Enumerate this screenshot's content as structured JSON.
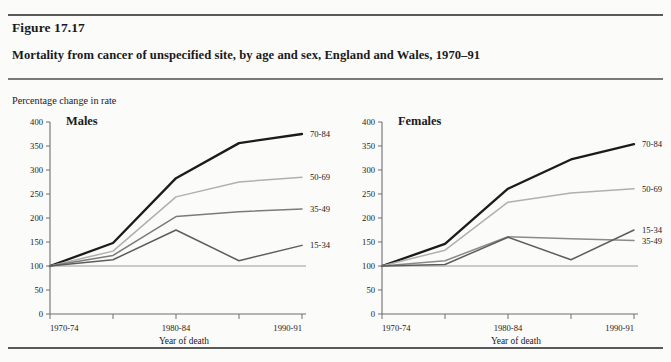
{
  "figure": {
    "number": "Figure 17.17",
    "caption": "Mortality from cancer of unspecified site, by age and sex, England and Wales, 1970–91",
    "y_axis_title": "Percentage change in rate"
  },
  "chart_data": [
    {
      "type": "line",
      "title": "Males",
      "xlabel": "Year of death",
      "ylabel": "Percentage change in rate",
      "categories": [
        "1970-74",
        "1975-79",
        "1980-84",
        "1985-89",
        "1990-91"
      ],
      "xtick_labels_shown": [
        "1970-74",
        "1980-84",
        "1990-91"
      ],
      "ytick_labels": [
        "0",
        "50",
        "100",
        "150",
        "200",
        "250",
        "300",
        "350",
        "400"
      ],
      "ylim": [
        0,
        400
      ],
      "grid": false,
      "legend_position": "right-inline",
      "series": [
        {
          "name": "70-84",
          "values": [
            100,
            148,
            283,
            356,
            375
          ],
          "color": "#1b1b1b",
          "width": 2.3
        },
        {
          "name": "50-69",
          "values": [
            100,
            131,
            244,
            275,
            285
          ],
          "color": "#b0b0b0",
          "width": 1.5
        },
        {
          "name": "35-49",
          "values": [
            100,
            122,
            203,
            213,
            219
          ],
          "color": "#7b7b7b",
          "width": 1.5
        },
        {
          "name": "15-34",
          "values": [
            100,
            113,
            175,
            111,
            143
          ],
          "color": "#5d5d5d",
          "width": 1.5
        }
      ]
    },
    {
      "type": "line",
      "title": "Females",
      "xlabel": "Year of death",
      "ylabel": "Percentage change in rate",
      "categories": [
        "1970-74",
        "1975-79",
        "1980-84",
        "1985-89",
        "1990-91"
      ],
      "xtick_labels_shown": [
        "1970-74",
        "1980-84",
        "1990-91"
      ],
      "ytick_labels": [
        "0",
        "50",
        "100",
        "150",
        "200",
        "250",
        "300",
        "350",
        "400"
      ],
      "ylim": [
        0,
        400
      ],
      "grid": false,
      "legend_position": "right-inline",
      "series": [
        {
          "name": "70-84",
          "values": [
            100,
            146,
            261,
            322,
            354
          ],
          "color": "#1b1b1b",
          "width": 2.3
        },
        {
          "name": "50-69",
          "values": [
            100,
            133,
            233,
            252,
            261
          ],
          "color": "#b0b0b0",
          "width": 1.5
        },
        {
          "name": "35-49",
          "values": [
            100,
            111,
            161,
            157,
            153
          ],
          "color": "#8a8a8a",
          "width": 1.5
        },
        {
          "name": "15-34",
          "values": [
            100,
            103,
            160,
            113,
            175
          ],
          "color": "#5d5d5d",
          "width": 1.5
        }
      ]
    }
  ],
  "panels": {
    "males": {
      "title": "Males",
      "xaxis_title": "Year of death",
      "xticks": [
        "1970-74",
        "1980-84",
        "1990-91"
      ],
      "yticks": [
        "400",
        "350",
        "300",
        "250",
        "200",
        "150",
        "100",
        "50",
        "0"
      ],
      "series_labels": [
        "70-84",
        "50-69",
        "35-49",
        "15-34"
      ]
    },
    "females": {
      "title": "Females",
      "xaxis_title": "Year of death",
      "xticks": [
        "1970-74",
        "1980-84",
        "1990-91"
      ],
      "yticks": [
        "400",
        "350",
        "300",
        "250",
        "200",
        "150",
        "100",
        "50",
        "0"
      ],
      "series_labels": [
        "70-84",
        "50-69",
        "15-34",
        "35-49"
      ]
    }
  },
  "colors": {
    "axis": "#6f6f6f",
    "text": "#1a1a1a",
    "background": "#fbfbfa",
    "rule": "#5a5a5a"
  }
}
